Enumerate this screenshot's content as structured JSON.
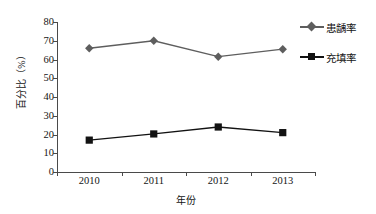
{
  "chart_data": {
    "type": "line",
    "title": "",
    "xlabel": "年份",
    "ylabel": "百分比（%）",
    "categories": [
      "2010",
      "2011",
      "2012",
      "2013"
    ],
    "ylim": [
      0,
      80
    ],
    "yticks": [
      "0",
      "10",
      "20",
      "30",
      "40",
      "50",
      "60",
      "70",
      "80"
    ],
    "grid": false,
    "legend_position": "right",
    "series": [
      {
        "name": "患龋率",
        "marker": "diamond",
        "color": "#5e5e5e",
        "values": [
          66,
          70,
          61.5,
          65.5
        ]
      },
      {
        "name": "充填率",
        "marker": "square",
        "color": "#121212",
        "values": [
          17,
          20.3,
          24,
          21
        ]
      }
    ]
  },
  "legend": {
    "items": [
      {
        "label": "患龋率"
      },
      {
        "label": "充填率"
      }
    ]
  },
  "axis": {
    "x_title": "年份",
    "y_title": "百分比（%）"
  },
  "colors": {
    "series_1": "#5e5e5e",
    "series_2": "#121212",
    "axis": "#4a4a4a",
    "background": "#ffffff"
  }
}
